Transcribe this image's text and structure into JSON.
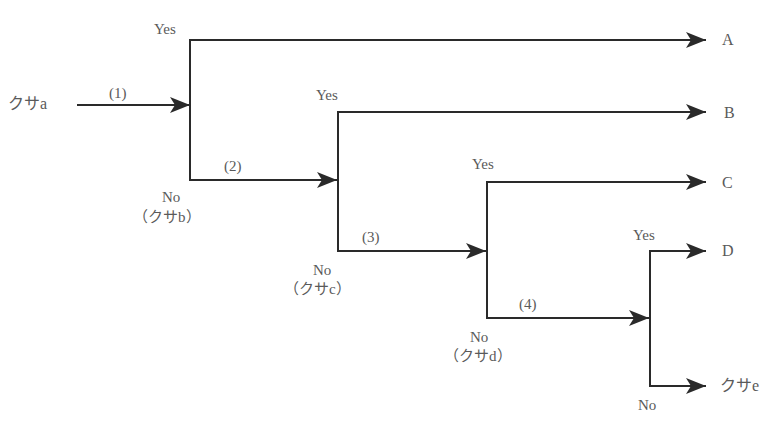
{
  "diagram": {
    "type": "decision-tree",
    "line_color": "#2a2a2a",
    "text_color": "#5a5a5a",
    "input": {
      "label": "クサa"
    },
    "steps": [
      {
        "label": "(1)"
      },
      {
        "label": "(2)"
      },
      {
        "label": "(3)"
      },
      {
        "label": "(4)"
      }
    ],
    "branches": [
      {
        "yes_label": "Yes",
        "yes_result": "A",
        "no_label": "No",
        "no_sub": "（クサb）"
      },
      {
        "yes_label": "Yes",
        "yes_result": "B",
        "no_label": "No",
        "no_sub": "（クサc）"
      },
      {
        "yes_label": "Yes",
        "yes_result": "C",
        "no_label": "No",
        "no_sub": "（クサd）"
      },
      {
        "yes_label": "Yes",
        "yes_result": "D",
        "no_label": "No",
        "no_result": "クサe"
      }
    ]
  }
}
